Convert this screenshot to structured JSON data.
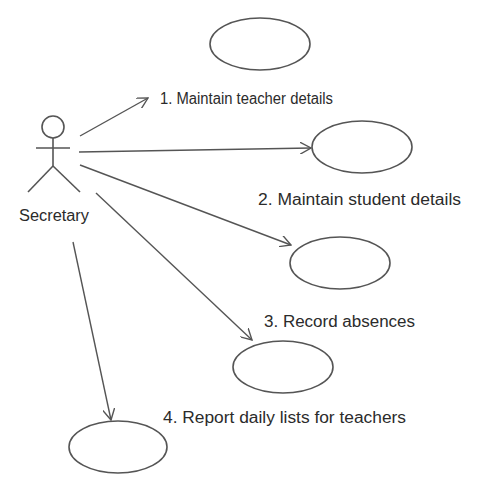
{
  "diagram": {
    "type": "uml-use-case",
    "actor": {
      "name": "Secretary"
    },
    "use_cases": [
      {
        "id": 1,
        "label": "1. Maintain teacher details"
      },
      {
        "id": 2,
        "label": "2. Maintain student details"
      },
      {
        "id": 3,
        "label": "3. Record absences"
      },
      {
        "id": 4,
        "label": "4. Report daily lists for teachers"
      }
    ],
    "colors": {
      "stroke": "#555555",
      "text": "#2b2b2b",
      "background": "#ffffff"
    }
  }
}
